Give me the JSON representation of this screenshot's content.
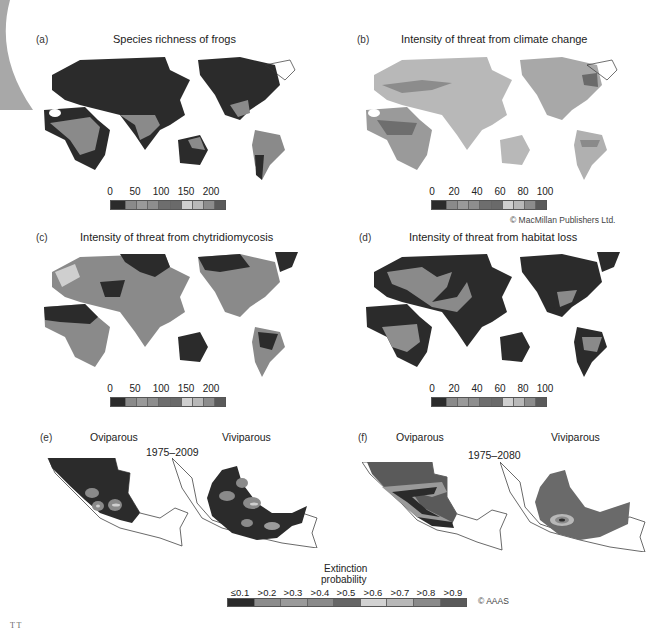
{
  "figure": {
    "corner_mark": "T T",
    "panels": [
      {
        "id": "a",
        "letter": "(a)",
        "title": "Species richness of frogs",
        "colorbar": {
          "ticks": [
            "0",
            "50",
            "100",
            "150",
            "200"
          ],
          "range": [
            0,
            230
          ]
        }
      },
      {
        "id": "b",
        "letter": "(b)",
        "title": "Intensity of threat from climate change",
        "colorbar": {
          "ticks": [
            "0",
            "20",
            "40",
            "60",
            "80",
            "100"
          ],
          "range": [
            0,
            100
          ]
        },
        "credit": "© MacMillan Publishers  Ltd."
      },
      {
        "id": "c",
        "letter": "(c)",
        "title": "Intensity of threat from chytridiomycosis",
        "colorbar": {
          "ticks": [
            "0",
            "50",
            "100",
            "150",
            "200"
          ],
          "range": [
            0,
            230
          ]
        }
      },
      {
        "id": "d",
        "letter": "(d)",
        "title": "Intensity of threat from habitat loss",
        "colorbar": {
          "ticks": [
            "0",
            "20",
            "40",
            "60",
            "80",
            "100"
          ],
          "range": [
            0,
            100
          ]
        }
      },
      {
        "id": "e",
        "letter": "(e)",
        "left_label": "Oviparous",
        "right_label": "Viviparous",
        "period": "1975–2009"
      },
      {
        "id": "f",
        "letter": "(f)",
        "left_label": "Oviparous",
        "right_label": "Viviparous",
        "period": "1975–2080"
      }
    ],
    "extinction_legend": {
      "title_line1": "Extinction",
      "title_line2": "probability",
      "labels": [
        "≤0.1",
        ">0.2",
        ">0.3",
        ">0.4",
        ">0.5",
        ">0.6",
        ">0.7",
        ">0.8",
        ">0.9"
      ],
      "credit": "© AAAS"
    },
    "colorbar_swatches": [
      "#2b2b2b",
      "#8a8a8a",
      "#9a9a9a",
      "#8e8e8e",
      "#6e6e6e",
      "#6a6a6a",
      "#cfcfcf",
      "#b8b8b8",
      "#8c8c8c",
      "#5a5a5a"
    ],
    "extinction_swatches": [
      "#2b2b2b",
      "#8c8c8c",
      "#9a9a9a",
      "#8a8a8a",
      "#666666",
      "#d2d2d2",
      "#b8b8b8",
      "#8a8a8a",
      "#5a5a5a"
    ]
  }
}
